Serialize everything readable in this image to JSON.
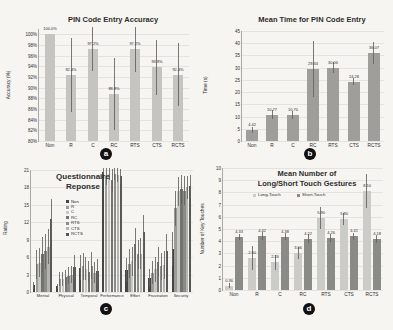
{
  "colors": {
    "background": "#f6f5f2",
    "axis": "#aaa9a6",
    "grid": "#e4e3e0",
    "text": "#2e2d2b",
    "badge_bg": "#111111",
    "badge_text": "#ffffff",
    "error_bar": "#63625f"
  },
  "chart_data": [
    {
      "id": "a",
      "type": "bar",
      "badge": "a",
      "title": "PIN Code Entry Accuracy",
      "ylabel": "Accuracy (%)",
      "categories": [
        "Non",
        "R",
        "C",
        "RC",
        "RTS",
        "CTS",
        "RCTS"
      ],
      "values": [
        100.0,
        92.4,
        97.2,
        88.8,
        97.2,
        93.8,
        92.4
      ],
      "value_labels": [
        "100.0%",
        "92.4%",
        "97.2%",
        "88.8%",
        "97.2%",
        "93.8%",
        "92.4%"
      ],
      "errors": [
        0,
        6.9,
        4.1,
        6.8,
        4.3,
        5.2,
        5.9
      ],
      "ylim": [
        80,
        101
      ],
      "ytick_vals": [
        80,
        82,
        84,
        86,
        88,
        90,
        92,
        94,
        96,
        98,
        100
      ],
      "ytick_labels": [
        "80%",
        "82%",
        "84%",
        "86%",
        "88%",
        "90%",
        "92%",
        "94%",
        "96%",
        "98%",
        "100%"
      ],
      "grid_on": true,
      "bar_color": "#c5c4c1",
      "bar_px": 10
    },
    {
      "id": "b",
      "type": "bar",
      "badge": "b",
      "title": "Mean Time for PIN Code Entry",
      "ylabel": "Time (s)",
      "categories": [
        "Non",
        "R",
        "C",
        "RC",
        "RTS",
        "CTS",
        "RCTS"
      ],
      "values": [
        4.42,
        10.77,
        10.7,
        29.34,
        30.06,
        24.28,
        36.07
      ],
      "value_labels": [
        "4.42",
        "10.77",
        "10.70",
        "29.34",
        "30.06",
        "24.28",
        "36.07"
      ],
      "errors": [
        1.2,
        1.9,
        1.6,
        11.5,
        2.2,
        1.4,
        4.6
      ],
      "ylim": [
        0,
        45
      ],
      "ytick_vals": [
        0,
        5,
        10,
        15,
        20,
        25,
        30,
        35,
        40,
        45
      ],
      "ytick_labels": [
        "0",
        "5",
        "10",
        "15",
        "20",
        "25",
        "30",
        "35",
        "40",
        "45"
      ],
      "grid_on": true,
      "bar_color": "#9f9e9b",
      "bar_px": 12
    },
    {
      "id": "c",
      "type": "grouped-bar",
      "badge": "c",
      "title": "Questionnaire\nReponse",
      "ylabel": "Rating",
      "categories": [
        "Mental",
        "Physical",
        "Temporal",
        "Performance",
        "Effort",
        "Frustration",
        "Security"
      ],
      "legend": [
        "Non",
        "R",
        "C",
        "RC",
        "RTS",
        "CTS",
        "RCTS"
      ],
      "legend_position": "upper-left-inside",
      "series": [
        {
          "name": "Non",
          "color": "#454543",
          "values": [
            1.2,
            1.0,
            4.2,
            20.7,
            3.8,
            2.4,
            7.4
          ],
          "errors": [
            0.6,
            0.4,
            2.2,
            0.8,
            2.0,
            1.5,
            3.0
          ]
        },
        {
          "name": "R",
          "color": "#9b9b98",
          "values": [
            4.8,
            2.2,
            4.4,
            20.0,
            4.9,
            3.3,
            14.4
          ],
          "errors": [
            2.5,
            1.2,
            2.3,
            1.5,
            2.5,
            2.0,
            3.0
          ]
        },
        {
          "name": "C",
          "color": "#c7c7c4",
          "values": [
            5.0,
            2.3,
            4.0,
            20.3,
            5.3,
            3.9,
            17.3
          ],
          "errors": [
            2.5,
            1.2,
            2.0,
            1.0,
            2.5,
            2.2,
            2.5
          ]
        },
        {
          "name": "RC",
          "color": "#73736f",
          "values": [
            6.5,
            2.5,
            3.5,
            19.2,
            8.2,
            5.2,
            17.7
          ],
          "errors": [
            3.0,
            1.3,
            1.8,
            2.0,
            2.8,
            2.5,
            2.5
          ]
        },
        {
          "name": "RTS",
          "color": "#8b8b88",
          "values": [
            7.0,
            2.8,
            4.5,
            20.3,
            6.5,
            4.4,
            17.4
          ],
          "errors": [
            3.0,
            1.5,
            2.3,
            1.0,
            2.5,
            2.3,
            2.5
          ]
        },
        {
          "name": "CTS",
          "color": "#b3b3b0",
          "values": [
            7.8,
            3.0,
            3.3,
            20.2,
            6.6,
            4.6,
            18.0
          ],
          "errors": [
            3.0,
            1.5,
            1.8,
            1.2,
            2.7,
            2.4,
            2.0
          ]
        },
        {
          "name": "RCTS",
          "color": "#585856",
          "values": [
            12.5,
            4.3,
            3.6,
            19.9,
            10.3,
            7.0,
            18.2
          ],
          "errors": [
            3.5,
            2.0,
            2.0,
            1.3,
            3.0,
            3.0,
            2.0
          ]
        }
      ],
      "ylim": [
        0,
        21
      ],
      "ytick_vals": [
        0,
        3,
        6,
        9,
        12,
        15,
        18,
        21
      ],
      "ytick_labels": [
        "0",
        "3",
        "6",
        "9",
        "12",
        "15",
        "18",
        "21"
      ],
      "grid_on": true,
      "bar_px": 2.4,
      "gap_px": 0.5
    },
    {
      "id": "d",
      "type": "grouped-bar",
      "badge": "d",
      "title": "Mean Number of\nLong/Short Touch Gestures",
      "ylabel": "Number of Key Touches",
      "categories": [
        "Non",
        "R",
        "C",
        "RC",
        "RTS",
        "CTS",
        "RCTS"
      ],
      "legend": [
        "Long-Touch",
        "Short-Touch"
      ],
      "legend_position": "top-inside",
      "series": [
        {
          "name": "Long-Touch",
          "color": "#cbcbc8",
          "values": [
            0.36,
            2.6,
            2.26,
            3.06,
            5.9,
            5.8,
            8.1
          ],
          "value_labels": [
            "0.36",
            "2.60",
            "2.26",
            "3.06",
            "5.90",
            "5.80",
            "8.10"
          ],
          "errors": [
            0.2,
            1.0,
            0.6,
            0.5,
            0.9,
            0.5,
            1.4
          ]
        },
        {
          "name": "Short-Touch",
          "color": "#8a8a87",
          "values": [
            4.33,
            4.42,
            4.38,
            4.22,
            4.26,
            4.41,
            4.18
          ],
          "value_labels": [
            "4.33",
            "4.42",
            "4.38",
            "4.22",
            "4.26",
            "4.41",
            "4.18"
          ],
          "errors": [
            0.25,
            0.3,
            0.3,
            0.35,
            0.3,
            0.3,
            0.3
          ]
        }
      ],
      "ylim": [
        0,
        10
      ],
      "ytick_vals": [
        0,
        1,
        2,
        3,
        4,
        5,
        6,
        7,
        8,
        9,
        10
      ],
      "ytick_labels": [
        "0",
        "1",
        "2",
        "3",
        "4",
        "5",
        "6",
        "7",
        "8",
        "9",
        "10"
      ],
      "grid_on": true,
      "bar_px": 8,
      "gap_px": 2
    }
  ]
}
